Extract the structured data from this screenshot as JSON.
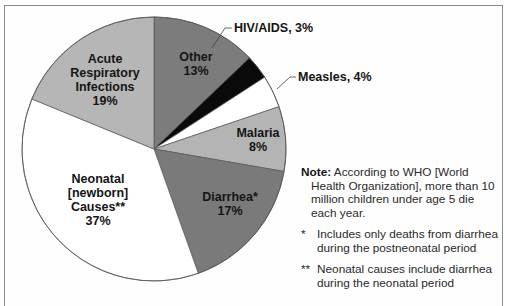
{
  "chart_data": {
    "type": "pie",
    "title": "",
    "start_angle_deg": 0,
    "direction": "clockwise",
    "slices": [
      {
        "label": "Other",
        "value": 13,
        "display": "13%",
        "color": "#7c7c7c"
      },
      {
        "label": "HIV/AIDS",
        "value": 3,
        "display": "3%",
        "color": "#0a0a0a"
      },
      {
        "label": "Measles",
        "value": 4,
        "display": "4%",
        "color": "#ffffff"
      },
      {
        "label": "Malaria",
        "value": 8,
        "display": "8%",
        "color": "#b4b4b4"
      },
      {
        "label": "Diarrhea*",
        "value": 17,
        "display": "17%",
        "color": "#7a7a7a"
      },
      {
        "label": "Neonatal [newborn] Causes**",
        "value": 37,
        "display": "37%",
        "color": "#ffffff"
      },
      {
        "label": "Acute Respiratory Infections",
        "value": 19,
        "display": "19%",
        "color": "#b6b6b6"
      }
    ],
    "units": "percent of deaths of children under age 5"
  },
  "labels": {
    "other": {
      "name": "Other",
      "pct": "13%"
    },
    "hiv": "HIV/AIDS, 3%",
    "measles": "Measles, 4%",
    "malaria": {
      "name": "Malaria",
      "pct": "8%"
    },
    "diarrhea": {
      "name": "Diarrhea*",
      "pct": "17%"
    },
    "neonatal": {
      "line1": "Neonatal",
      "line2": "[newborn]",
      "line3": "Causes**",
      "pct": "37%"
    },
    "ari": {
      "line1": "Acute",
      "line2": "Respiratory",
      "line3": "Infections",
      "pct": "19%"
    }
  },
  "note": {
    "label": "Note:",
    "text": " According to WHO [World Health Organization], more than 10 million children under age 5 die each year.",
    "footnotes": [
      {
        "mark": "*",
        "text": "Includes only deaths from diarrhea during the postneonatal period"
      },
      {
        "mark": "**",
        "text": "Neonatal causes include diarrhea during the neonatal period"
      }
    ]
  }
}
